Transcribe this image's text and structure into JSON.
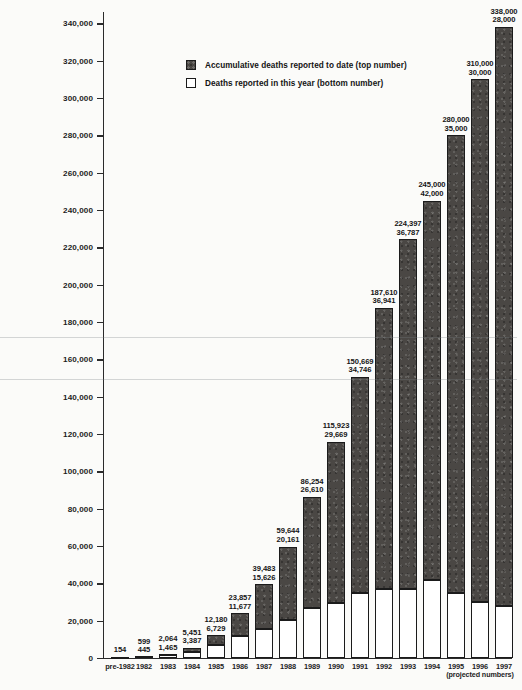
{
  "chart_data": {
    "type": "bar",
    "title": "",
    "subtitle": "",
    "xlabel": "",
    "ylabel": "",
    "ylim": [
      0,
      345000
    ],
    "grid": false,
    "legend_position": "top-center",
    "yticks": [
      "0",
      "20,000",
      "40,000",
      "60,000",
      "80,000",
      "100,000",
      "120,000",
      "140,000",
      "160,000",
      "180,000",
      "200,000",
      "220,000",
      "240,000",
      "260,000",
      "280,000",
      "300,000",
      "320,000",
      "340,000"
    ],
    "ytick_values": [
      0,
      20000,
      40000,
      60000,
      80000,
      100000,
      120000,
      140000,
      160000,
      180000,
      200000,
      220000,
      240000,
      260000,
      280000,
      300000,
      320000,
      340000
    ],
    "categories": [
      "pre-1982",
      "1982",
      "1983",
      "1984",
      "1985",
      "1986",
      "1987",
      "1988",
      "1989",
      "1990",
      "1991",
      "1992",
      "1993",
      "1994",
      "1995",
      "1996",
      "1997"
    ],
    "series": [
      {
        "name": "Accumulative deaths reported to date (top number)",
        "color": "#4a4744",
        "values": [
          154,
          599,
          2064,
          5451,
          12180,
          23857,
          39483,
          59644,
          86254,
          115923,
          150669,
          187610,
          224397,
          245000,
          280000,
          310000,
          338000
        ]
      },
      {
        "name": "Deaths reported in this year (bottom number)",
        "color": "#ffffff",
        "values": [
          null,
          445,
          1465,
          3387,
          6729,
          11677,
          15626,
          20161,
          26610,
          29669,
          34746,
          36941,
          36787,
          42000,
          35000,
          30000,
          28000
        ]
      }
    ],
    "bars": [
      {
        "year": "pre-1982",
        "cumulative": 154,
        "cumulative_label": "154",
        "annual": null,
        "annual_label": ""
      },
      {
        "year": "1982",
        "cumulative": 599,
        "cumulative_label": "599",
        "annual": 445,
        "annual_label": "445"
      },
      {
        "year": "1983",
        "cumulative": 2064,
        "cumulative_label": "2,064",
        "annual": 1465,
        "annual_label": "1,465"
      },
      {
        "year": "1984",
        "cumulative": 5451,
        "cumulative_label": "5,451",
        "annual": 3387,
        "annual_label": "3,387"
      },
      {
        "year": "1985",
        "cumulative": 12180,
        "cumulative_label": "12,180",
        "annual": 6729,
        "annual_label": "6,729"
      },
      {
        "year": "1986",
        "cumulative": 23857,
        "cumulative_label": "23,857",
        "annual": 11677,
        "annual_label": "11,677"
      },
      {
        "year": "1987",
        "cumulative": 39483,
        "cumulative_label": "39,483",
        "annual": 15626,
        "annual_label": "15,626"
      },
      {
        "year": "1988",
        "cumulative": 59644,
        "cumulative_label": "59,644",
        "annual": 20161,
        "annual_label": "20,161"
      },
      {
        "year": "1989",
        "cumulative": 86254,
        "cumulative_label": "86,254",
        "annual": 26610,
        "annual_label": "26,610"
      },
      {
        "year": "1990",
        "cumulative": 115923,
        "cumulative_label": "115,923",
        "annual": 29669,
        "annual_label": "29,669"
      },
      {
        "year": "1991",
        "cumulative": 150669,
        "cumulative_label": "150,669",
        "annual": 34746,
        "annual_label": "34,746"
      },
      {
        "year": "1992",
        "cumulative": 187610,
        "cumulative_label": "187,610",
        "annual": 36941,
        "annual_label": "36,941"
      },
      {
        "year": "1993",
        "cumulative": 224397,
        "cumulative_label": "224,397",
        "annual": 36787,
        "annual_label": "36,787"
      },
      {
        "year": "1994",
        "cumulative": 245000,
        "cumulative_label": "245,000",
        "annual": 42000,
        "annual_label": "42,000"
      },
      {
        "year": "1995",
        "cumulative": 280000,
        "cumulative_label": "280,000",
        "annual": 35000,
        "annual_label": "35,000"
      },
      {
        "year": "1996",
        "cumulative": 310000,
        "cumulative_label": "310,000",
        "annual": 30000,
        "annual_label": "30,000"
      },
      {
        "year": "1997",
        "cumulative": 338000,
        "cumulative_label": "338,000",
        "annual": 28000,
        "annual_label": "28,000"
      }
    ],
    "annotations": [
      {
        "text": "(projected numbers)",
        "applies_to": [
          "1995",
          "1996",
          "1997"
        ]
      }
    ]
  },
  "legend": {
    "items": [
      {
        "label": "Accumulative deaths reported to date (top number)",
        "swatch": "dark"
      },
      {
        "label": "Deaths reported in this year (bottom number)",
        "swatch": "light"
      }
    ]
  },
  "projected_note": "(projected numbers)",
  "caption": ""
}
